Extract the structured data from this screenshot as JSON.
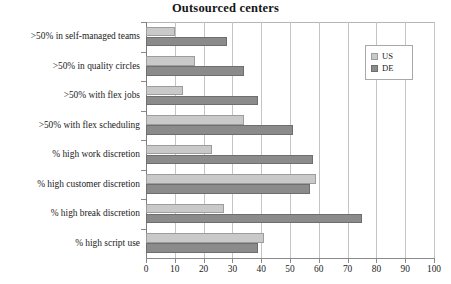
{
  "chart_data": {
    "type": "bar",
    "orientation": "horizontal",
    "title": "Outsourced centers",
    "xlabel": "",
    "ylabel": "",
    "xlim": [
      0,
      100
    ],
    "xticks": [
      0,
      10,
      20,
      30,
      40,
      50,
      60,
      70,
      80,
      90,
      100
    ],
    "grid": true,
    "legend_position": "top-right",
    "categories": [
      ">50% in self-managed teams",
      ">50% in quality circles",
      ">50% with flex jobs",
      ">50% with flex scheduling",
      "% high work discretion",
      "% high customer discretion",
      "% high break discretion",
      "% high script use"
    ],
    "series": [
      {
        "name": "US",
        "color": "#c9c9c9",
        "values": [
          10,
          17,
          13,
          34,
          23,
          59,
          27,
          41
        ]
      },
      {
        "name": "DE",
        "color": "#8b8b8b",
        "values": [
          28,
          34,
          39,
          51,
          58,
          57,
          75,
          39
        ]
      }
    ]
  }
}
